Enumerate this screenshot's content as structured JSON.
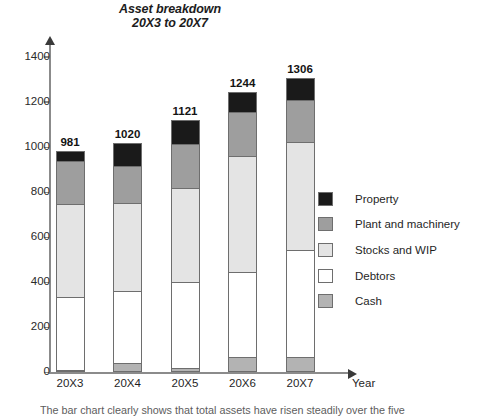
{
  "chart_data": {
    "type": "bar",
    "subtype": "stacked-vertical",
    "title": "Asset breakdown\n20X3 to 20X7",
    "title_line1": "Asset breakdown",
    "title_line2": "20X3 to 20X7",
    "xlabel": "Year",
    "ylabel": "",
    "ylim": [
      0,
      1400
    ],
    "y_ticks": [
      0,
      200,
      400,
      600,
      800,
      1000,
      1200,
      1400
    ],
    "y_tick_labels": [
      "0",
      "200",
      "400",
      "600",
      "800",
      "1000",
      "1200",
      "1400"
    ],
    "grid": false,
    "legend_position": "right",
    "categories": [
      "20X3",
      "20X4",
      "20X5",
      "20X6",
      "20X7"
    ],
    "totals": [
      981,
      1020,
      1121,
      1244,
      1306
    ],
    "total_labels": [
      "981",
      "1020",
      "1121",
      "1244",
      "1306"
    ],
    "stack_order_bottom_to_top": [
      "Cash",
      "Debtors",
      "Stocks and WIP",
      "Plant and machinery",
      "Property"
    ],
    "series": [
      {
        "name": "Cash",
        "color": "#b3b3b3",
        "values": [
          5,
          40,
          20,
          70,
          70
        ]
      },
      {
        "name": "Debtors",
        "color": "#ffffff",
        "values": [
          328,
          323,
          383,
          374,
          474
        ]
      },
      {
        "name": "Stocks and WIP",
        "color": "#e4e4e4",
        "values": [
          411,
          390,
          416,
          516,
          478
        ]
      },
      {
        "name": "Plant and machinery",
        "color": "#9e9e9e",
        "values": [
          190,
          164,
          197,
          197,
          186
        ]
      },
      {
        "name": "Property",
        "color": "#1a1a1a",
        "values": [
          47,
          103,
          105,
          87,
          98
        ]
      }
    ],
    "legend_entries": [
      {
        "label": "Property",
        "color": "#1a1a1a"
      },
      {
        "label": "Plant and machinery",
        "color": "#9e9e9e"
      },
      {
        "label": "Stocks and WIP",
        "color": "#e4e4e4"
      },
      {
        "label": "Debtors",
        "color": "#ffffff"
      },
      {
        "label": "Cash",
        "color": "#b3b3b3"
      }
    ]
  },
  "caption": "The bar chart clearly shows that total assets have risen steadily over the five"
}
